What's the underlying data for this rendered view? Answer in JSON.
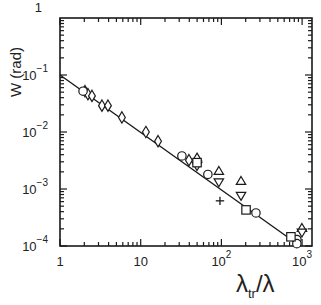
{
  "chart_data": {
    "type": "scatter",
    "title": "",
    "xlabel": "λtr/λ",
    "xlabel_main": "λ",
    "xlabel_sub": "tr",
    "xlabel_tail": "/λ",
    "ylabel": "W (rad)",
    "xscale": "log",
    "yscale": "log",
    "xlim": [
      1,
      1250
    ],
    "ylim": [
      0.0001,
      1
    ],
    "grid": false,
    "legend": null,
    "x_ticks": [
      {
        "value": 1,
        "base": "1",
        "exp": ""
      },
      {
        "value": 10,
        "base": "10",
        "exp": ""
      },
      {
        "value": 100,
        "base": "10",
        "exp": "2"
      },
      {
        "value": 1000,
        "base": "10",
        "exp": "3"
      }
    ],
    "y_ticks": [
      {
        "value": 1,
        "base": "1",
        "exp": ""
      },
      {
        "value": 0.1,
        "base": "10",
        "exp": "−1"
      },
      {
        "value": 0.01,
        "base": "10",
        "exp": "−2"
      },
      {
        "value": 0.001,
        "base": "10",
        "exp": "−3"
      },
      {
        "value": 0.0001,
        "base": "10",
        "exp": "−4"
      }
    ],
    "fit_line": {
      "x": [
        1,
        900
      ],
      "y": [
        0.1,
        0.000105
      ],
      "description": "W ≈ 0.1 · (λtr/λ)^−1"
    },
    "series": [
      {
        "name": "diamonds",
        "marker": "diamond",
        "points": [
          [
            2.04,
            0.052
          ],
          [
            2.22,
            0.046
          ],
          [
            2.49,
            0.043
          ],
          [
            3.31,
            0.029
          ],
          [
            3.93,
            0.029
          ],
          [
            5.85,
            0.018
          ],
          [
            11.6,
            0.01
          ],
          [
            16.4,
            0.0069
          ],
          [
            39.6,
            0.0032
          ]
        ]
      },
      {
        "name": "circles",
        "marker": "circle",
        "points": [
          [
            1.93,
            0.052
          ],
          [
            32.4,
            0.0038
          ],
          [
            68,
            0.0018
          ],
          [
            268,
            0.00038
          ],
          [
            861,
            0.00013
          ],
          [
            861,
            0.00011
          ]
        ]
      },
      {
        "name": "triangles-up",
        "marker": "triangle-up",
        "points": [
          [
            49.9,
            0.0036
          ],
          [
            93,
            0.0021
          ],
          [
            175,
            0.0014
          ],
          [
            995,
            0.00021
          ]
        ]
      },
      {
        "name": "triangles-down",
        "marker": "triangle-down",
        "points": [
          [
            49.9,
            0.0025
          ],
          [
            93,
            0.0013
          ],
          [
            175,
            0.00075
          ],
          [
            995,
            0.00017
          ]
        ]
      },
      {
        "name": "squares",
        "marker": "square",
        "points": [
          [
            49.9,
            0.0029
          ],
          [
            202,
            0.00043
          ],
          [
            727,
            0.000145
          ]
        ]
      },
      {
        "name": "plus",
        "marker": "plus",
        "points": [
          [
            96,
            0.00062
          ]
        ]
      }
    ]
  }
}
